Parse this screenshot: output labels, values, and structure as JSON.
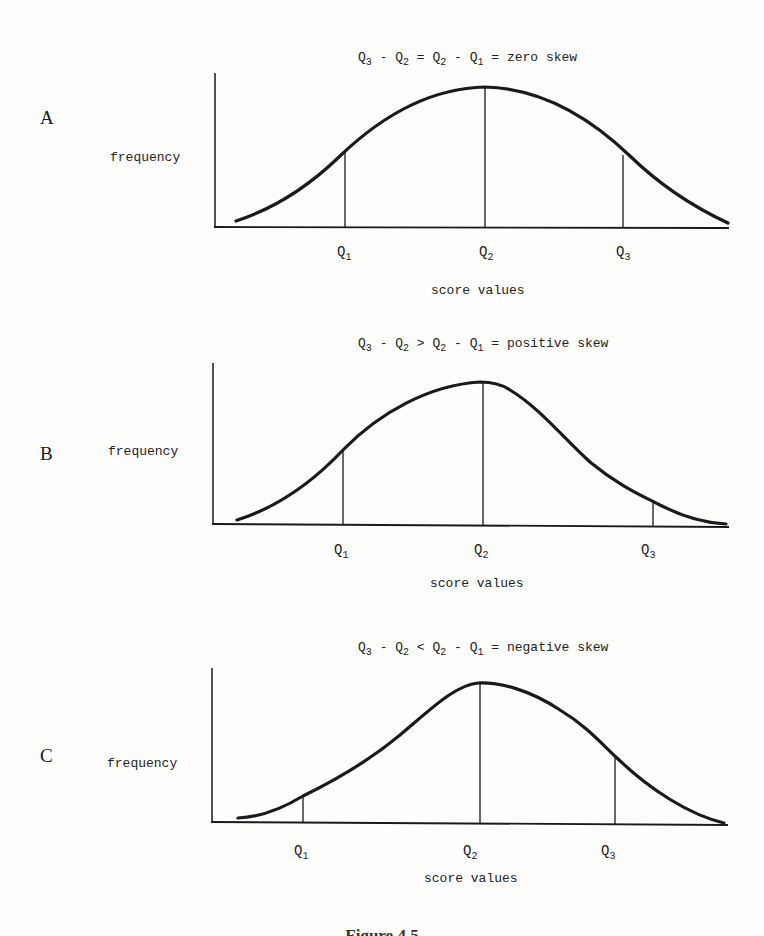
{
  "figure": {
    "caption_partial": "Figure 4.5"
  },
  "panels": [
    {
      "letter": "A",
      "ylabel": "frequency",
      "xlabel": "score values",
      "title": {
        "lhs_a": "Q",
        "lhs_a_sub": "3",
        "op1": " - ",
        "lhs_b": "Q",
        "lhs_b_sub": "2",
        "rel": " = ",
        "rhs_a": "Q",
        "rhs_a_sub": "2",
        "op2": " - ",
        "rhs_b": "Q",
        "rhs_b_sub": "1",
        "result": " = zero skew"
      },
      "quartiles": [
        {
          "q": "Q",
          "sub": "1"
        },
        {
          "q": "Q",
          "sub": "2"
        },
        {
          "q": "Q",
          "sub": "3"
        }
      ]
    },
    {
      "letter": "B",
      "ylabel": "frequency",
      "xlabel": "score values",
      "title": {
        "lhs_a": "Q",
        "lhs_a_sub": "3",
        "op1": " - ",
        "lhs_b": "Q",
        "lhs_b_sub": "2",
        "rel": " > ",
        "rhs_a": "Q",
        "rhs_a_sub": "2",
        "op2": " - ",
        "rhs_b": "Q",
        "rhs_b_sub": "1",
        "result": " = positive skew"
      },
      "quartiles": [
        {
          "q": "Q",
          "sub": "1"
        },
        {
          "q": "Q",
          "sub": "2"
        },
        {
          "q": "Q",
          "sub": "3"
        }
      ]
    },
    {
      "letter": "C",
      "ylabel": "frequency",
      "xlabel": "score values",
      "title": {
        "lhs_a": "Q",
        "lhs_a_sub": "3",
        "op1": " - ",
        "lhs_b": "Q",
        "lhs_b_sub": "2",
        "rel": " < ",
        "rhs_a": "Q",
        "rhs_a_sub": "2",
        "op2": " - ",
        "rhs_b": "Q",
        "rhs_b_sub": "1",
        "result": " = negative skew"
      },
      "quartiles": [
        {
          "q": "Q",
          "sub": "1"
        },
        {
          "q": "Q",
          "sub": "2"
        },
        {
          "q": "Q",
          "sub": "3"
        }
      ]
    }
  ],
  "colors": {
    "ink": "#1a1a1a",
    "paper": "#fdfdfc"
  }
}
